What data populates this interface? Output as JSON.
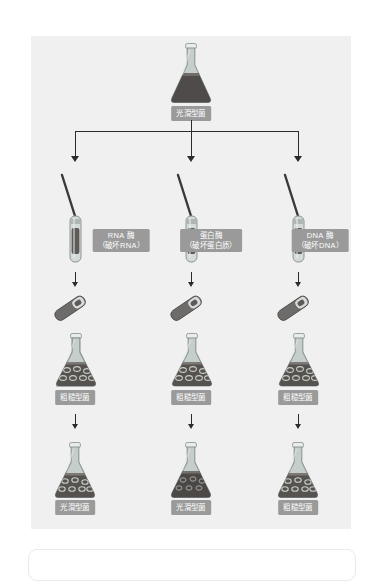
{
  "figure": {
    "title_label": "光滑型菌",
    "colors": {
      "panel_bg": "#f0f0f1",
      "badge_bg": "#9a9a9a",
      "badge_text": "#fdfdfd",
      "line": "#2b2b2b",
      "flask_glass": "#b9c3c0",
      "flask_liquid_dark": "#4e4b4a",
      "flask_liquid_mid": "#6f6b68"
    },
    "top": {
      "flask_label": "光滑型菌",
      "flask_name": "erlenmeyer-flask-dark"
    },
    "branches": [
      {
        "enzyme_line1": "RNA 酶",
        "enzyme_line2": "（破坏RNA）",
        "tube_name": "pipette-test-tube",
        "mid_flask_label": "粗糙型菌",
        "result_label": "光滑型菌"
      },
      {
        "enzyme_line1": "蛋白酶",
        "enzyme_line2": "（破坏蛋白质）",
        "tube_name": "pipette-test-tube",
        "mid_flask_label": "粗糙型菌",
        "result_label": "光滑型菌"
      },
      {
        "enzyme_line1": "DNA 酶",
        "enzyme_line2": "（破坏DNA）",
        "tube_name": "pipette-test-tube",
        "mid_flask_label": "粗糙型菌",
        "result_label": "粗糙型菌"
      }
    ]
  }
}
